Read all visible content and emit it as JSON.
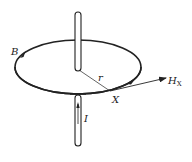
{
  "diagram": {
    "labels": {
      "field": "B",
      "radius": "r",
      "point": "X",
      "field_intensity": "H",
      "field_intensity_sub": "X",
      "current": "I"
    },
    "colors": {
      "stroke": "#222222",
      "background": "#ffffff"
    }
  }
}
